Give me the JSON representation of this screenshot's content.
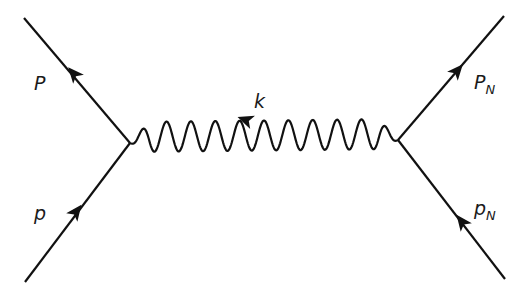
{
  "diagram": {
    "type": "feynman",
    "colors": {
      "line": "#111111",
      "background": "#ffffff",
      "text": "#1a1a1a"
    },
    "vertices": [
      {
        "id": "v_left",
        "x": 130,
        "y": 143
      },
      {
        "id": "v_right",
        "x": 398,
        "y": 140
      }
    ],
    "fermion_lines": [
      {
        "id": "incoming-top-left",
        "from": [
          24,
          18
        ],
        "to": [
          130,
          143
        ],
        "arrow_at": [
          75,
          76
        ],
        "arrow_direction": "up-left",
        "label": "P"
      },
      {
        "id": "incoming-bottom-left",
        "from": [
          25,
          282
        ],
        "to": [
          130,
          143
        ],
        "arrow_at": [
          75,
          214
        ],
        "arrow_direction": "up-right",
        "label": "p"
      },
      {
        "id": "outgoing-top-right",
        "from": [
          398,
          140
        ],
        "to": [
          504,
          16
        ],
        "arrow_at": [
          458,
          70
        ],
        "arrow_direction": "up-right",
        "label_main": "P",
        "label_sub": "N"
      },
      {
        "id": "outgoing-bottom-right",
        "from": [
          505,
          279
        ],
        "to": [
          398,
          140
        ],
        "arrow_at": [
          464,
          224
        ],
        "arrow_direction": "up-left",
        "label_main": "p",
        "label_sub": "N"
      }
    ],
    "boson_line": {
      "id": "photon-propagator",
      "style": "wavy",
      "from": [
        130,
        143
      ],
      "to": [
        398,
        140
      ],
      "oscillations": 11,
      "arrow_direction": "left",
      "label": "k"
    }
  },
  "labels": {
    "top_left": "P",
    "bottom_left": "p",
    "top_right_main": "P",
    "top_right_sub": "N",
    "bottom_right_main": "p",
    "bottom_right_sub": "N",
    "propagator": "k"
  }
}
